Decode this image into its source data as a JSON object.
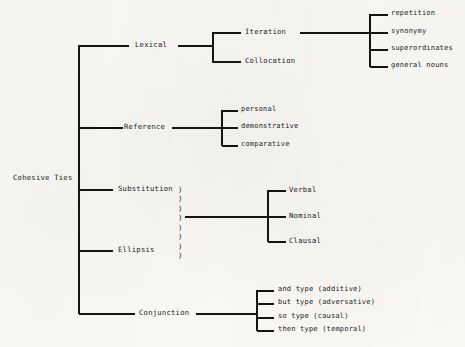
{
  "diagram": {
    "title": "Cohesive Ties",
    "type": "tree-diagram",
    "root": {
      "label": "Cohesive Ties"
    },
    "branches": [
      {
        "label": "Lexical",
        "children": [
          {
            "label": "Iteration",
            "children": [
              {
                "label": "repetition"
              },
              {
                "label": "synonymy"
              },
              {
                "label": "superordinates"
              },
              {
                "label": "general nouns"
              }
            ]
          },
          {
            "label": "Collocation"
          }
        ]
      },
      {
        "label": "Reference",
        "children": [
          {
            "label": "personal"
          },
          {
            "label": "demonstrative"
          },
          {
            "label": "comparative"
          }
        ]
      },
      {
        "label": "Substitution",
        "shared_with": "Ellipsis",
        "children": [
          {
            "label": "Verbal"
          },
          {
            "label": "Nominal"
          },
          {
            "label": "Clausal"
          }
        ]
      },
      {
        "label": "Ellipsis"
      },
      {
        "label": "Conjunction",
        "children": [
          {
            "label": "and type (additive)"
          },
          {
            "label": "but type (adversative)"
          },
          {
            "label": "so type (causal)"
          },
          {
            "label": "then type (temporal)"
          }
        ]
      }
    ],
    "brace_glyphs": ")\n)\n)\n)\n)\n)\n)\n)",
    "colors": {
      "ink": "#141414",
      "paper": "#fbfaf7"
    }
  }
}
